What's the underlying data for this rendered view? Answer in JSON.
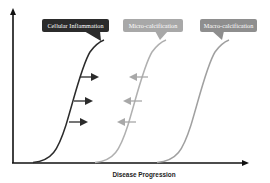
{
  "diagram": {
    "title": "",
    "x_axis_label": "Disease Progression",
    "y_axis_label": "",
    "colors": {
      "axis": "#111111",
      "inflammation": "#2b2b2b",
      "micro_calcification": "#a8a8a8",
      "macro_calcification": "#9a9a9a",
      "callout_text": "#ffffff"
    },
    "callouts": [
      {
        "id": "inflammation",
        "label": "Cellular Inflammation",
        "style": "dark"
      },
      {
        "id": "micro",
        "label": "Micro-calcification",
        "style": "mid"
      },
      {
        "id": "macro",
        "label": "Macro-calcification",
        "style": "light"
      }
    ],
    "curves": [
      {
        "name": "Cellular Inflammation curve",
        "color": "#2b2b2b",
        "start_x": 34,
        "end_x": 104
      },
      {
        "name": "Micro-calcification curve",
        "color": "#b0b0b0",
        "start_x": 95,
        "end_x": 166
      },
      {
        "name": "Macro-calcification curve",
        "color": "#a0a0a0",
        "start_x": 156,
        "end_x": 230
      }
    ],
    "shift_arrows": [
      {
        "group": "inflammation",
        "direction": "right",
        "color": "#2b2b2b",
        "count": 3
      },
      {
        "group": "micro-calcification",
        "direction": "left",
        "color": "#a8a8a8",
        "count": 3
      }
    ]
  }
}
